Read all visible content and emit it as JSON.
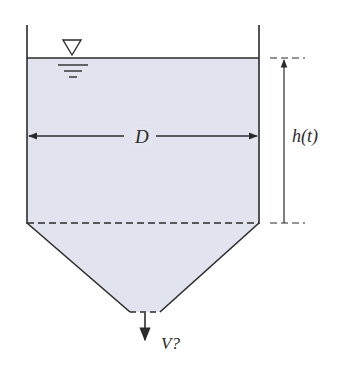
{
  "diagram": {
    "title": "",
    "type": "tank-draining",
    "labels": {
      "diameter": "D",
      "height": "h(t)",
      "outflow_velocity": "V?"
    },
    "symbols": {
      "free_surface": "inverted-triangle-water-level-icon"
    },
    "colors": {
      "liquid_fill": "#e1e4ee",
      "stroke": "#2b2b2b",
      "background": "#ffffff"
    },
    "components": [
      "cylindrical tank section of diameter D",
      "conical bottom section",
      "bottom outlet with downward flow",
      "liquid height h(t) measured from top of cone to free surface"
    ]
  }
}
